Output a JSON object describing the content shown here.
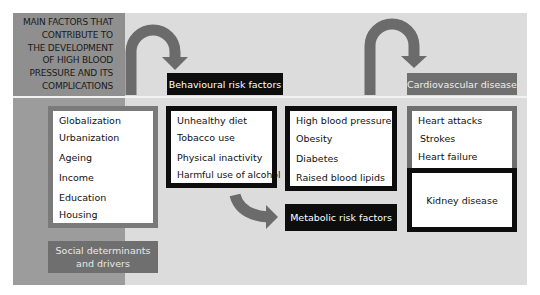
{
  "title": "MAIN FACTORS THAT CONTRIBUTE TO THE DEVELOPMENT OF HIGH BLOOD PRESSURE AND ITS COMPLICATIONS",
  "title_lines": [
    "MAIN FACTORS THAT",
    "CONTRIBUTE TO",
    "THE DEVELOPMENT",
    "OF HIGH BLOOD",
    "PRESSURE AND ITS",
    "COMPLICATIONS"
  ],
  "colors": {
    "panel": "#dcdcdc",
    "left_column": "#9c9c9c",
    "title_block": "#8f8f8f",
    "arrow": "#6b6b6b",
    "gray_label": "#6f6f6f",
    "black_label": "#0d0d0d"
  },
  "groups": [
    {
      "label": "Social determinants and drivers",
      "label_lines": [
        "Social determinants",
        "and drivers"
      ],
      "items": [
        "Globalization",
        "Urbanization",
        "Ageing",
        "Income",
        "Education",
        "Housing"
      ]
    },
    {
      "label": "Behavioural risk factors",
      "items": [
        "Unhealthy diet",
        "Tobacco use",
        "Physical inactivity",
        "Harmful use of alcohol"
      ]
    },
    {
      "label": "Metabolic risk factors",
      "items": [
        "High blood pressure",
        "Obesity",
        "Diabetes",
        "Raised blood lipids"
      ]
    },
    {
      "label": "Cardiovascular disease",
      "items": [
        "Heart attacks",
        "Strokes",
        "Heart failure"
      ]
    },
    {
      "label": "",
      "items": [
        "Kidney disease"
      ]
    }
  ],
  "arrows": [
    {
      "from": "Social determinants and drivers",
      "to": "Behavioural risk factors"
    },
    {
      "from": "Behavioural risk factors",
      "to": "Metabolic risk factors"
    },
    {
      "from": "Metabolic risk factors",
      "to": "Cardiovascular disease"
    }
  ]
}
